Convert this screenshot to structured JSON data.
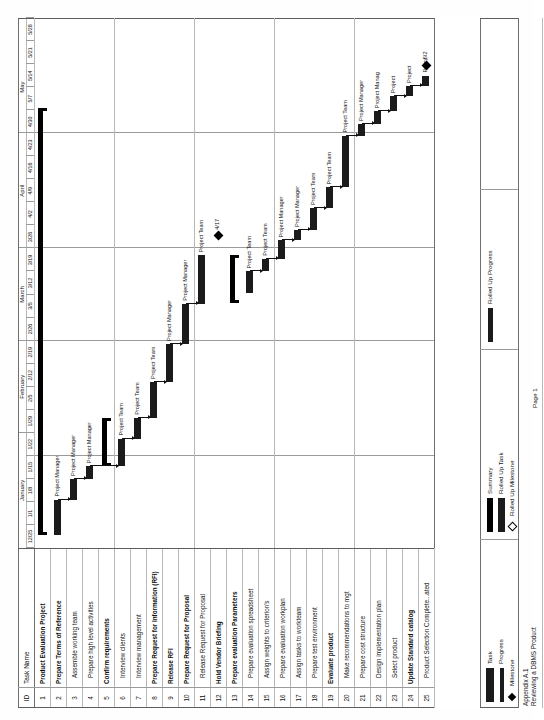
{
  "document": {
    "appendix_line1": "Appendix A.1",
    "appendix_line2": "Reviewing a DBMS Product",
    "page_label": "Page 1"
  },
  "table": {
    "header_id": "ID",
    "header_name": "Task Name",
    "rows": [
      {
        "id": "1",
        "name": "Product Evaluation Project",
        "bold": true,
        "indent": false
      },
      {
        "id": "2",
        "name": "Prepare Terms of Reference",
        "bold": true,
        "indent": false
      },
      {
        "id": "3",
        "name": "Assemble working team",
        "bold": false,
        "indent": true
      },
      {
        "id": "4",
        "name": "Prepare high level activities",
        "bold": false,
        "indent": true
      },
      {
        "id": "5",
        "name": "Confirm requirements",
        "bold": true,
        "indent": false
      },
      {
        "id": "6",
        "name": "Interview clients",
        "bold": false,
        "indent": true
      },
      {
        "id": "7",
        "name": "Interview management",
        "bold": false,
        "indent": true
      },
      {
        "id": "8",
        "name": "Prepare Request for Information (RFI)",
        "bold": true,
        "indent": false
      },
      {
        "id": "9",
        "name": "Release RFI",
        "bold": true,
        "indent": false
      },
      {
        "id": "10",
        "name": "Prepare Request for Proposal",
        "bold": true,
        "indent": false
      },
      {
        "id": "11",
        "name": "Release Request for Proposal",
        "bold": false,
        "indent": true
      },
      {
        "id": "12",
        "name": "Hold Vendor Briefing",
        "bold": true,
        "indent": false
      },
      {
        "id": "13",
        "name": "Prepare evaluation Parameters",
        "bold": true,
        "indent": false
      },
      {
        "id": "14",
        "name": "Prepare evaluation spreadsheet",
        "bold": false,
        "indent": true
      },
      {
        "id": "15",
        "name": "Assign weights to criterion's",
        "bold": false,
        "indent": true
      },
      {
        "id": "16",
        "name": "Prepare evaluation workplan",
        "bold": false,
        "indent": true
      },
      {
        "id": "17",
        "name": "Assign tasks to workteam",
        "bold": false,
        "indent": true
      },
      {
        "id": "18",
        "name": "Prepare test environment",
        "bold": false,
        "indent": true
      },
      {
        "id": "19",
        "name": "Evaluate product",
        "bold": true,
        "indent": false
      },
      {
        "id": "20",
        "name": "Make recommendations to mgt",
        "bold": false,
        "indent": true
      },
      {
        "id": "21",
        "name": "Prepare cost structure",
        "bold": false,
        "indent": true
      },
      {
        "id": "22",
        "name": "Design implementation plan",
        "bold": false,
        "indent": true
      },
      {
        "id": "23",
        "name": "Select product",
        "bold": false,
        "indent": true
      },
      {
        "id": "24",
        "name": "Update Standard catalog",
        "bold": true,
        "indent": false
      },
      {
        "id": "25",
        "name": "Product Selection Complete...ated",
        "bold": false,
        "indent": true
      }
    ]
  },
  "timeline": {
    "months": [
      {
        "label": "January",
        "span": 5
      },
      {
        "label": "February",
        "span": 4
      },
      {
        "label": "March",
        "span": 4
      },
      {
        "label": "April",
        "span": 5
      },
      {
        "label": "May",
        "span": 4
      }
    ],
    "weeks": [
      "12/25",
      "1/1",
      "1/8",
      "1/15",
      "1/22",
      "1/29",
      "2/5",
      "2/12",
      "2/19",
      "2/26",
      "3/5",
      "3/12",
      "3/19",
      "3/26",
      "4/2",
      "4/9",
      "4/16",
      "4/23",
      "4/30",
      "5/7",
      "5/14",
      "5/21",
      "5/28"
    ]
  },
  "chart_data": {
    "type": "bar",
    "xlabel": "",
    "ylabel": "",
    "axis_start": "12/25",
    "axis_end": "5/28",
    "week_count": 23,
    "bars": [
      {
        "row": 1,
        "kind": "summary",
        "start_week": 0.55,
        "end_week": 19.1,
        "resource": ""
      },
      {
        "row": 2,
        "kind": "task",
        "start_week": 0.55,
        "end_week": 2.1,
        "resource": "Project Manager"
      },
      {
        "row": 3,
        "kind": "task",
        "start_week": 2.1,
        "end_week": 3.0,
        "resource": "Project Manager"
      },
      {
        "row": 4,
        "kind": "task",
        "start_week": 3.0,
        "end_week": 3.55,
        "resource": "Project Manager"
      },
      {
        "row": 5,
        "kind": "summary",
        "start_week": 3.55,
        "end_week": 5.65,
        "resource": ""
      },
      {
        "row": 6,
        "kind": "task",
        "start_week": 3.55,
        "end_week": 4.75,
        "resource": "Project Team"
      },
      {
        "row": 7,
        "kind": "task",
        "start_week": 4.75,
        "end_week": 5.65,
        "resource": "Project Team"
      },
      {
        "row": 8,
        "kind": "task",
        "start_week": 5.65,
        "end_week": 7.2,
        "resource": "Project Team"
      },
      {
        "row": 9,
        "kind": "task",
        "start_week": 7.2,
        "end_week": 8.85,
        "resource": "Project Manager"
      },
      {
        "row": 10,
        "kind": "task",
        "start_week": 8.85,
        "end_week": 10.6,
        "resource": "Project Manager"
      },
      {
        "row": 11,
        "kind": "task",
        "start_week": 10.6,
        "end_week": 12.7,
        "resource": "Project Team"
      },
      {
        "row": 12,
        "kind": "milestone",
        "start_week": 13.55,
        "end_week": 13.55,
        "resource": "",
        "label": "4/17"
      },
      {
        "row": 13,
        "kind": "summary",
        "start_week": 10.65,
        "end_week": 12.7,
        "resource": ""
      },
      {
        "row": 14,
        "kind": "task",
        "start_week": 11.05,
        "end_week": 12.0,
        "resource": "Project Team"
      },
      {
        "row": 15,
        "kind": "task",
        "start_week": 12.0,
        "end_week": 12.55,
        "resource": "Project Team"
      },
      {
        "row": 16,
        "kind": "task",
        "start_week": 12.55,
        "end_week": 13.35,
        "resource": "Project Manager"
      },
      {
        "row": 17,
        "kind": "task",
        "start_week": 13.35,
        "end_week": 13.8,
        "resource": "Project Manager"
      },
      {
        "row": 18,
        "kind": "task",
        "start_week": 13.8,
        "end_week": 14.75,
        "resource": "Project Team"
      },
      {
        "row": 19,
        "kind": "task",
        "start_week": 14.75,
        "end_week": 15.65,
        "resource": "Project Team"
      },
      {
        "row": 20,
        "kind": "task",
        "start_week": 15.65,
        "end_week": 17.9,
        "resource": "Project Team"
      },
      {
        "row": 21,
        "kind": "task",
        "start_week": 17.9,
        "end_week": 18.4,
        "resource": "Project Manager"
      },
      {
        "row": 22,
        "kind": "task",
        "start_week": 18.4,
        "end_week": 18.95,
        "resource": "Project Manag"
      },
      {
        "row": 23,
        "kind": "task",
        "start_week": 18.95,
        "end_week": 19.6,
        "resource": "Project"
      },
      {
        "row": 24,
        "kind": "task",
        "start_week": 19.6,
        "end_week": 20.05,
        "resource": "Project"
      },
      {
        "row": 25,
        "kind": "task",
        "start_week": 20.05,
        "end_week": 20.5,
        "resource": "Policy"
      },
      {
        "row": 25,
        "kind": "milestone",
        "start_week": 20.95,
        "end_week": 20.95,
        "resource": "",
        "label": "5/2"
      }
    ]
  },
  "legend": {
    "groups": [
      {
        "items": [
          {
            "label": "Task",
            "swatch": "task"
          },
          {
            "label": "Progress",
            "swatch": "progress"
          },
          {
            "label": "Milestone",
            "swatch": "milestone"
          }
        ]
      },
      {
        "items": [
          {
            "label": "Summary",
            "swatch": "summary"
          },
          {
            "label": "Rolled Up Task",
            "swatch": "rolled-up-task"
          },
          {
            "label": "Rolled Up Milestone",
            "swatch": "rolled-up-milestone"
          }
        ]
      },
      {
        "items": [
          {
            "label": "Rolled Up Progress",
            "swatch": "rolled-up-progress"
          }
        ]
      }
    ]
  }
}
